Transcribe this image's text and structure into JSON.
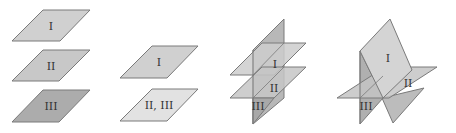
{
  "figure": {
    "colors": {
      "light": "#d2d2d2",
      "medium": "#c0c0c0",
      "dark": "#a8a8a8",
      "edge": "#7a7a7a",
      "label": "#333333"
    },
    "panels": [
      {
        "id": "panel-1",
        "caption": "Three parallel planes",
        "labels": [
          "I",
          "II",
          "III"
        ]
      },
      {
        "id": "panel-2",
        "caption": "Two coincident planes parallel to a third",
        "labels": [
          "I",
          "II, III"
        ]
      },
      {
        "id": "panel-3",
        "caption": "Two parallel planes cut by a third",
        "labels": [
          "I",
          "II",
          "III"
        ]
      },
      {
        "id": "panel-4",
        "caption": "Three planes meeting pairwise",
        "labels": [
          "I",
          "II",
          "III"
        ]
      }
    ]
  }
}
